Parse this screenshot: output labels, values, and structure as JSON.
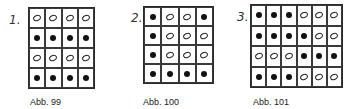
{
  "figures": [
    {
      "number": "1.",
      "caption": "Abb. 99",
      "columns": 4,
      "rows": [
        [
          "open",
          "open",
          "open",
          "open"
        ],
        [
          "filled",
          "filled",
          "filled",
          "filled"
        ],
        [
          "open",
          "open",
          "open",
          "open"
        ],
        [
          "filled",
          "filled",
          "filled",
          "filled"
        ]
      ]
    },
    {
      "number": "2.",
      "caption": "Abb. 100",
      "columns": 4,
      "rows": [
        [
          "filled",
          "open",
          "open",
          "filled"
        ],
        [
          "filled",
          "open",
          "open",
          "open"
        ],
        [
          "filled",
          "open",
          "open",
          "open"
        ],
        [
          "filled",
          "filled",
          "filled",
          "filled"
        ]
      ]
    },
    {
      "number": "3.",
      "caption": "Abb. 101",
      "columns": 6,
      "rows": [
        [
          "filled",
          "filled",
          "filled",
          "open",
          "open",
          "open"
        ],
        [
          "filled",
          "filled",
          "filled",
          "filled",
          "open",
          "open"
        ],
        [
          "open",
          "open",
          "open",
          "filled",
          "filled",
          "filled"
        ],
        [
          "filled",
          "filled",
          "filled",
          "open",
          "open",
          "open"
        ]
      ]
    }
  ]
}
